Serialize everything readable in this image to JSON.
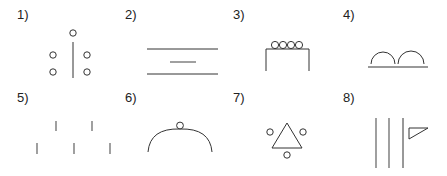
{
  "panels": [
    {
      "label": "1)",
      "description": "vertical line with one circle above and two circles on each side"
    },
    {
      "label": "2)",
      "description": "two long horizontal lines with a short line between"
    },
    {
      "label": "3)",
      "description": "table shape with four circles on top"
    },
    {
      "label": "4)",
      "description": "two arches on a baseline"
    },
    {
      "label": "5)",
      "description": "five short vertical ticks in zigzag arrangement"
    },
    {
      "label": "6)",
      "description": "arc with small circle at apex"
    },
    {
      "label": "7)",
      "description": "triangle with three circles around it"
    },
    {
      "label": "8)",
      "description": "three vertical lines with a triangular flag"
    }
  ],
  "colors": {
    "stroke": "#333333",
    "gray_stroke": "#777777",
    "background": "#ffffff"
  }
}
